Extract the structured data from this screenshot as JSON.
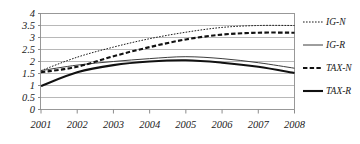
{
  "chart_data": {
    "type": "line",
    "title": "",
    "xlabel": "",
    "ylabel": "",
    "x": [
      2001,
      2002,
      2003,
      2004,
      2005,
      2006,
      2007,
      2008
    ],
    "categories": [
      "2001",
      "2002",
      "2003",
      "2004",
      "2005",
      "2006",
      "2007",
      "2008"
    ],
    "xlim": [
      2001,
      2008
    ],
    "ylim": [
      0,
      4
    ],
    "yticks": [
      0,
      0.5,
      1,
      1.5,
      2,
      2.5,
      3,
      3.5,
      4
    ],
    "ytick_labels": [
      "0",
      "0.5",
      "1",
      "1.5",
      "2",
      "2.5",
      "3",
      "3.5",
      "4"
    ],
    "grid": true,
    "legend_position": "right",
    "series": [
      {
        "name": "IG-N",
        "style": "dotted",
        "color": "#1a1a1a",
        "width": 1.0,
        "values": [
          1.62,
          2.18,
          2.6,
          2.95,
          3.22,
          3.42,
          3.5,
          3.5
        ]
      },
      {
        "name": "IG-R",
        "style": "solid",
        "color": "#3d3d3d",
        "width": 1.0,
        "values": [
          1.62,
          1.85,
          2.0,
          2.12,
          2.2,
          2.12,
          1.95,
          1.72
        ]
      },
      {
        "name": "TAX-N",
        "style": "dashed",
        "color": "#111111",
        "width": 2.1,
        "values": [
          1.55,
          1.78,
          2.22,
          2.6,
          2.92,
          3.12,
          3.2,
          3.2
        ]
      },
      {
        "name": "TAX-R",
        "style": "solid",
        "color": "#111111",
        "width": 2.1,
        "values": [
          0.98,
          1.55,
          1.85,
          2.0,
          2.05,
          1.95,
          1.78,
          1.52
        ]
      }
    ]
  },
  "legend": {
    "items": [
      {
        "label": "IG-N"
      },
      {
        "label": "IG-R"
      },
      {
        "label": "TAX-N"
      },
      {
        "label": "TAX-R"
      }
    ]
  }
}
